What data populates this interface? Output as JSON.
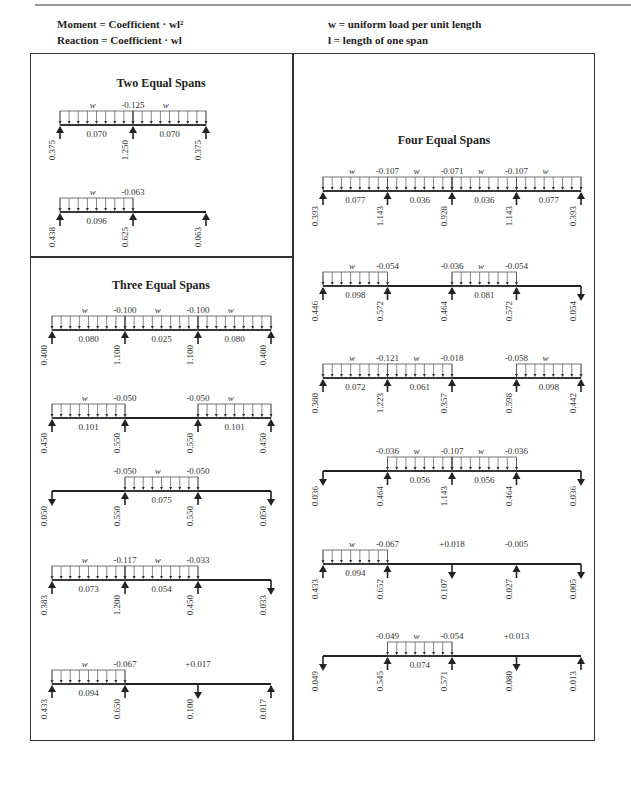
{
  "header": {
    "moment_def": "Moment = Coefficient · wl²",
    "reaction_def": "Reaction = Coefficient · wl",
    "w_def": "w = uniform load per unit length",
    "l_def": "l = length of one span"
  },
  "sections": {
    "two": {
      "title": "Two Equal Spans",
      "cases": [
        {
          "loaded": [
            1,
            1
          ],
          "neg_moments": [
            "-0.125"
          ],
          "pos_moments": [
            "0.070",
            "0.070"
          ],
          "reactions": [
            "0.375",
            "1.250",
            "0.375"
          ],
          "reaction_dirs": [
            "up",
            "up",
            "up"
          ]
        },
        {
          "loaded": [
            1,
            0
          ],
          "neg_moments": [
            "-0.063"
          ],
          "pos_moments": [
            "0.096",
            ""
          ],
          "reactions": [
            "0.438",
            "0.625",
            "0.063"
          ],
          "reaction_dirs": [
            "up",
            "up",
            "up"
          ]
        }
      ]
    },
    "three": {
      "title": "Three Equal Spans",
      "cases": [
        {
          "loaded": [
            1,
            1,
            1
          ],
          "neg_moments": [
            "-0.100",
            "-0.100"
          ],
          "pos_moments": [
            "0.080",
            "0.025",
            "0.080"
          ],
          "reactions": [
            "0.400",
            "1.100",
            "1.100",
            "0.400"
          ],
          "reaction_dirs": [
            "up",
            "up",
            "up",
            "up"
          ]
        },
        {
          "loaded": [
            1,
            0,
            1
          ],
          "neg_moments": [
            "-0.050",
            "-0.050"
          ],
          "pos_moments": [
            "0.101",
            "",
            "0.101"
          ],
          "reactions": [
            "0.450",
            "0.550",
            "0.550",
            "0.450"
          ],
          "reaction_dirs": [
            "up",
            "up",
            "up",
            "up"
          ]
        },
        {
          "loaded": [
            0,
            1,
            0
          ],
          "neg_moments": [
            "-0.050",
            "-0.050"
          ],
          "pos_moments": [
            "",
            "0.075",
            ""
          ],
          "reactions": [
            "0.050",
            "0.550",
            "0.550",
            "0.050"
          ],
          "reaction_dirs": [
            "down",
            "up",
            "up",
            "down"
          ]
        },
        {
          "loaded": [
            1,
            1,
            0
          ],
          "neg_moments": [
            "-0.117",
            "-0.033"
          ],
          "pos_moments": [
            "0.073",
            "0.054",
            ""
          ],
          "reactions": [
            "0.383",
            "1.200",
            "0.450",
            "0.033"
          ],
          "reaction_dirs": [
            "up",
            "up",
            "up",
            "down"
          ]
        },
        {
          "loaded": [
            1,
            0,
            0
          ],
          "neg_moments": [
            "-0.067",
            "+0.017"
          ],
          "pos_moments": [
            "0.094",
            "",
            ""
          ],
          "reactions": [
            "0.433",
            "0.650",
            "0.100",
            "0.017"
          ],
          "reaction_dirs": [
            "up",
            "up",
            "down",
            "up"
          ]
        }
      ]
    },
    "four": {
      "title": "Four Equal Spans",
      "cases": [
        {
          "loaded": [
            1,
            1,
            1,
            1
          ],
          "neg_moments": [
            "-0.107",
            "-0.071",
            "-0.107"
          ],
          "pos_moments": [
            "0.077",
            "0.036",
            "0.036",
            "0.077"
          ],
          "reactions": [
            "0.393",
            "1.143",
            "0.928",
            "1.143",
            "0.393"
          ],
          "reaction_dirs": [
            "up",
            "up",
            "up",
            "up",
            "up"
          ]
        },
        {
          "loaded": [
            1,
            0,
            1,
            0
          ],
          "neg_moments": [
            "-0.054",
            "-0.036",
            "-0.054"
          ],
          "pos_moments": [
            "0.098",
            "",
            "0.081",
            ""
          ],
          "reactions": [
            "0.446",
            "0.572",
            "0.464",
            "0.572",
            "0.054"
          ],
          "reaction_dirs": [
            "up",
            "up",
            "up",
            "up",
            "down"
          ]
        },
        {
          "loaded": [
            1,
            1,
            0,
            1
          ],
          "neg_moments": [
            "-0.121",
            "-0.018",
            "-0.058"
          ],
          "pos_moments": [
            "0.072",
            "0.061",
            "",
            "0.098"
          ],
          "reactions": [
            "0.380",
            "1.223",
            "0.357",
            "0.598",
            "0.442"
          ],
          "reaction_dirs": [
            "up",
            "up",
            "up",
            "up",
            "up"
          ]
        },
        {
          "loaded": [
            0,
            1,
            1,
            0
          ],
          "neg_moments": [
            "-0.036",
            "-0.107",
            "-0.036"
          ],
          "pos_moments": [
            "",
            "0.056",
            "0.056",
            ""
          ],
          "reactions": [
            "0.036",
            "0.464",
            "1.143",
            "0.464",
            "0.036"
          ],
          "reaction_dirs": [
            "down",
            "up",
            "up",
            "up",
            "down"
          ]
        },
        {
          "loaded": [
            1,
            0,
            0,
            0
          ],
          "neg_moments": [
            "-0.067",
            "+0.018",
            "-0.005"
          ],
          "pos_moments": [
            "0.094",
            "",
            "",
            ""
          ],
          "reactions": [
            "0.433",
            "0.652",
            "0.107",
            "0.027",
            "0.005"
          ],
          "reaction_dirs": [
            "up",
            "up",
            "down",
            "up",
            "down"
          ]
        },
        {
          "loaded": [
            0,
            1,
            0,
            0
          ],
          "neg_moments": [
            "-0.049",
            "-0.054",
            "+0.013"
          ],
          "pos_moments": [
            "",
            "0.074",
            "",
            ""
          ],
          "reactions": [
            "0.049",
            "0.545",
            "0.571",
            "0.080",
            "0.013"
          ],
          "reaction_dirs": [
            "down",
            "up",
            "up",
            "down",
            "up"
          ]
        }
      ]
    }
  },
  "load_symbol": "w"
}
